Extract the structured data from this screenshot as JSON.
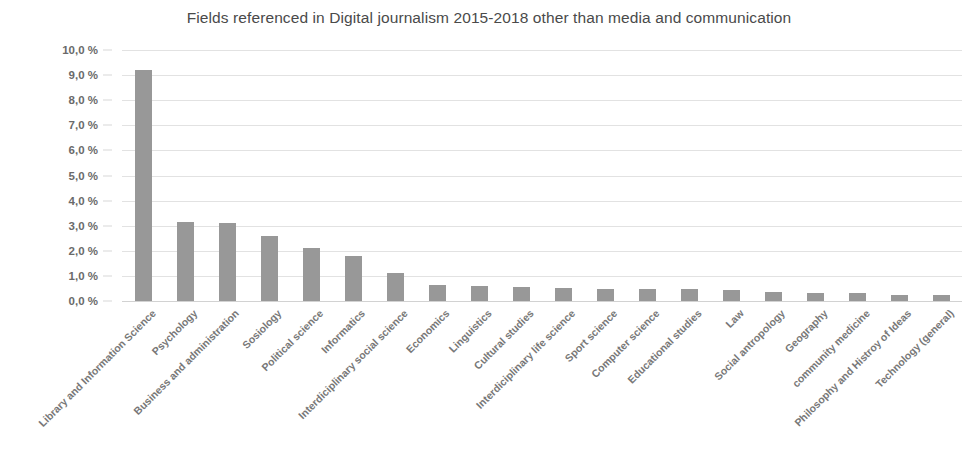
{
  "chart_data": {
    "type": "bar",
    "title": "Fields referenced in Digital journalism 2015-2018 other than media and communication",
    "xlabel": "",
    "ylabel": "",
    "ylim": [
      0,
      10
    ],
    "grid": true,
    "legend": false,
    "y_tick_labels": [
      "10,0 %",
      "9,0 %",
      "8,0 %",
      "7,0 %",
      "6,0 %",
      "5,0 %",
      "4,0 %",
      "3,0 %",
      "2,0 %",
      "1,0 %",
      "0,0 %"
    ],
    "y_tick_values": [
      10,
      9,
      8,
      7,
      6,
      5,
      4,
      3,
      2,
      1,
      0
    ],
    "value_suffix": " %",
    "bar_color": "#989898",
    "categories": [
      "Library and Information Science",
      "Psychology",
      "Business and administration",
      "Sosiology",
      "Political science",
      "Informatics",
      "Interdiciplinary social science",
      "Economics",
      "Linguistics",
      "Cultural studies",
      "Interdiciplinary life science",
      "Sport science",
      "Computer science",
      "Educational studies",
      "Law",
      "Social antropology",
      "Geography",
      "community medicine",
      "Philosophy and Histroy of Ideas",
      "Technology (general)"
    ],
    "values": [
      9.2,
      3.15,
      3.1,
      2.6,
      2.1,
      1.8,
      1.1,
      0.65,
      0.6,
      0.55,
      0.5,
      0.48,
      0.47,
      0.47,
      0.42,
      0.35,
      0.33,
      0.3,
      0.25,
      0.25
    ]
  }
}
